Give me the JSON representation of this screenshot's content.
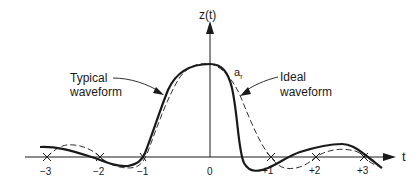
{
  "diagram": {
    "y_axis_label": "z(t)",
    "x_axis_label": "t",
    "tick_labels": [
      "−3",
      "−2",
      "−1",
      "0",
      "+1",
      "+2",
      "+3"
    ],
    "annotations": {
      "typical_line1": "Typical",
      "typical_line2": "waveform",
      "ideal_line1": "Ideal",
      "ideal_line2": "waveform",
      "peak_label_main": "a",
      "peak_label_sub": "r"
    },
    "curves": [
      {
        "name": "Typical waveform",
        "style": "solid-thick"
      },
      {
        "name": "Ideal waveform",
        "style": "dashed"
      }
    ],
    "colors": {
      "ink": "#1a1a1a",
      "background": "#ffffff"
    }
  }
}
